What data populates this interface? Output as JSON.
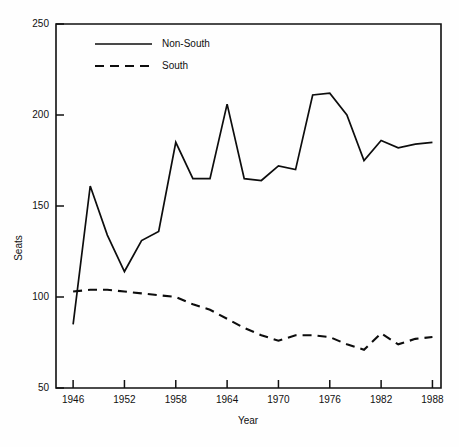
{
  "chart_data": {
    "type": "line",
    "title": "",
    "xlabel": "Year",
    "ylabel": "Seats",
    "xlim": [
      1944,
      1989
    ],
    "ylim": [
      50,
      250
    ],
    "xticks": [
      1946,
      1952,
      1958,
      1964,
      1970,
      1976,
      1982,
      1988
    ],
    "yticks": [
      50,
      100,
      150,
      200,
      250
    ],
    "grid": false,
    "legend_position": "top-left",
    "x": [
      1946,
      1948,
      1950,
      1952,
      1954,
      1956,
      1958,
      1960,
      1962,
      1964,
      1966,
      1968,
      1970,
      1972,
      1974,
      1976,
      1978,
      1980,
      1982,
      1984,
      1986,
      1988
    ],
    "series": [
      {
        "name": "Non-South",
        "style": "solid",
        "values": [
          85,
          161,
          134,
          114,
          131,
          136,
          185,
          165,
          165,
          206,
          165,
          164,
          172,
          170,
          211,
          212,
          200,
          175,
          186,
          182,
          184,
          185
        ]
      },
      {
        "name": "South",
        "style": "dashed",
        "values": [
          103,
          104,
          104,
          103,
          102,
          101,
          100,
          96,
          93,
          88,
          83,
          79,
          76,
          79,
          79,
          78,
          74,
          71,
          80,
          74,
          77,
          78
        ]
      }
    ]
  },
  "legend": {
    "entries": [
      {
        "label": "Non-South",
        "style": "solid"
      },
      {
        "label": "South",
        "style": "dashed"
      }
    ]
  },
  "axes": {
    "y_title": "Seats",
    "x_title": "Year",
    "y_tick_labels": [
      "50",
      "100",
      "150",
      "200",
      "250"
    ],
    "x_tick_labels": [
      "1946",
      "1952",
      "1958",
      "1964",
      "1970",
      "1976",
      "1982",
      "1988"
    ]
  }
}
